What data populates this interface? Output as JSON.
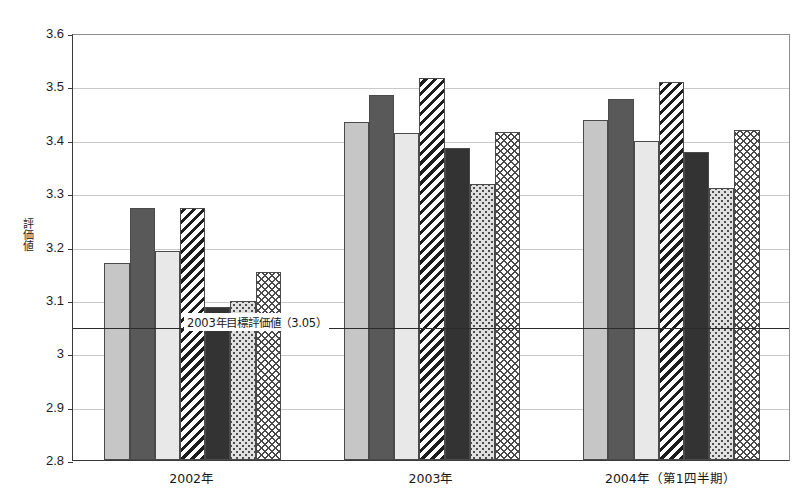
{
  "chart_data": {
    "type": "bar",
    "title": "",
    "xlabel": "",
    "ylabel": "評価値",
    "ylim": [
      2.8,
      3.6
    ],
    "ytick_labels": [
      "3.6",
      "3.5",
      "3.4",
      "3.3",
      "3.2",
      "3.1",
      "3",
      "2.9",
      "2.8"
    ],
    "ytick_values": [
      3.6,
      3.5,
      3.4,
      3.3,
      3.2,
      3.1,
      3.0,
      2.9,
      2.8
    ],
    "grid": true,
    "legend": "none",
    "categories": [
      "2002年",
      "2003年",
      "2004年（第1四半期）"
    ],
    "series": [
      {
        "name": "series-1",
        "pattern": "light-gray",
        "values": [
          3.17,
          3.433,
          3.437
        ]
      },
      {
        "name": "series-2",
        "pattern": "dark-gray",
        "values": [
          3.272,
          3.483,
          3.477
        ]
      },
      {
        "name": "series-3",
        "pattern": "pale-gray",
        "values": [
          3.192,
          3.413,
          3.397
        ]
      },
      {
        "name": "series-4",
        "pattern": "diagonal",
        "values": [
          3.273,
          3.515,
          3.508
        ]
      },
      {
        "name": "series-5",
        "pattern": "black",
        "values": [
          3.086,
          3.385,
          3.378
        ]
      },
      {
        "name": "series-6",
        "pattern": "dotted",
        "values": [
          3.098,
          3.317,
          3.31
        ]
      },
      {
        "name": "series-7",
        "pattern": "crosshatch",
        "values": [
          3.153,
          3.415,
          3.418
        ]
      }
    ],
    "annotations": [
      {
        "name": "target-line",
        "label": "2003年目標評価値（3.05）",
        "value": 3.05,
        "orientation": "horizontal"
      }
    ]
  }
}
